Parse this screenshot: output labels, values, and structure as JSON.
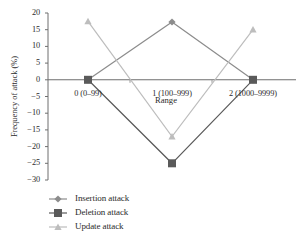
{
  "chart_data": {
    "type": "line",
    "title": "",
    "xlabel": "Range",
    "ylabel": "Frequency of attack (%)",
    "categories": [
      "0 (0–99)",
      "1 (100–999)",
      "2 (1000–9999)"
    ],
    "ylim": [
      -30,
      20
    ],
    "yticks": [
      20,
      15,
      10,
      5,
      0,
      -5,
      -10,
      -15,
      -20,
      -25,
      -30
    ],
    "ytick_labels": [
      "20",
      "15",
      "10",
      "5",
      "0",
      "−5",
      "−10",
      "−15",
      "−20",
      "−25",
      "−30"
    ],
    "grid": false,
    "legend_position": "bottom-left",
    "series": [
      {
        "name": "Insertion attack",
        "marker": "diamond",
        "color": "#8c8c8c",
        "values": [
          0,
          17.3,
          0
        ]
      },
      {
        "name": "Deletion attack",
        "marker": "square",
        "color": "#5a5a5a",
        "values": [
          0,
          -25,
          0
        ]
      },
      {
        "name": "Update attack",
        "marker": "triangle",
        "color": "#bdbdbd",
        "values": [
          17.5,
          -17,
          15
        ]
      }
    ]
  },
  "legend": {
    "items": [
      {
        "label": "Insertion attack"
      },
      {
        "label": "Deletion attack"
      },
      {
        "label": "Update attack"
      }
    ]
  }
}
